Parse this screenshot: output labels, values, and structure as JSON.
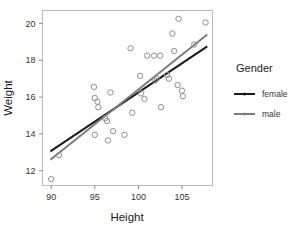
{
  "chart_data": {
    "type": "scatter",
    "title": "",
    "xlabel": "Height",
    "ylabel": "Weight",
    "xlim": [
      89.0,
      108.5
    ],
    "ylim": [
      11.2,
      20.7
    ],
    "xticks": [
      90,
      95,
      100,
      105
    ],
    "yticks": [
      12,
      14,
      16,
      18,
      20
    ],
    "xtick_labels": [
      "90",
      "95",
      "100",
      "105"
    ],
    "ytick_labels": [
      "12",
      "14",
      "16",
      "18",
      "20"
    ],
    "grid": false,
    "legend": {
      "title": "Gender",
      "position": "right",
      "entries": [
        {
          "label": "female",
          "color": "#1a1a1a"
        },
        {
          "label": "male",
          "color": "#7c7c7c"
        }
      ]
    },
    "marker": {
      "shape": "open-circle",
      "edge_color": "#8f8f8f",
      "fill": "none",
      "radius_px": 2.7
    },
    "points": [
      {
        "x": 90.0,
        "y": 11.55
      },
      {
        "x": 90.9,
        "y": 12.85
      },
      {
        "x": 94.9,
        "y": 16.55
      },
      {
        "x": 95.0,
        "y": 15.95
      },
      {
        "x": 95.0,
        "y": 13.95
      },
      {
        "x": 95.3,
        "y": 15.75
      },
      {
        "x": 95.4,
        "y": 15.45
      },
      {
        "x": 96.2,
        "y": 14.85
      },
      {
        "x": 96.4,
        "y": 14.7
      },
      {
        "x": 96.5,
        "y": 13.65
      },
      {
        "x": 96.8,
        "y": 16.25
      },
      {
        "x": 97.1,
        "y": 14.15
      },
      {
        "x": 98.4,
        "y": 13.95
      },
      {
        "x": 99.1,
        "y": 18.65
      },
      {
        "x": 99.3,
        "y": 15.15
      },
      {
        "x": 100.2,
        "y": 17.15
      },
      {
        "x": 100.3,
        "y": 16.2
      },
      {
        "x": 100.7,
        "y": 15.9
      },
      {
        "x": 101.0,
        "y": 18.25
      },
      {
        "x": 101.8,
        "y": 18.25
      },
      {
        "x": 101.9,
        "y": 16.9
      },
      {
        "x": 102.1,
        "y": 17.0
      },
      {
        "x": 102.5,
        "y": 18.25
      },
      {
        "x": 102.6,
        "y": 15.45
      },
      {
        "x": 103.3,
        "y": 17.2
      },
      {
        "x": 103.5,
        "y": 17.0
      },
      {
        "x": 103.9,
        "y": 19.45
      },
      {
        "x": 104.1,
        "y": 18.5
      },
      {
        "x": 104.5,
        "y": 16.65
      },
      {
        "x": 104.6,
        "y": 20.25
      },
      {
        "x": 105.0,
        "y": 16.35
      },
      {
        "x": 105.1,
        "y": 16.05
      },
      {
        "x": 106.4,
        "y": 18.85
      },
      {
        "x": 107.7,
        "y": 20.05
      }
    ],
    "fit_lines": [
      {
        "name": "female",
        "color": "#1a1a1a",
        "x_start": 89.9,
        "y_start": 13.05,
        "x_end": 107.9,
        "y_end": 18.75
      },
      {
        "name": "male",
        "color": "#7c7c7c",
        "x_start": 89.9,
        "y_start": 12.6,
        "x_end": 107.9,
        "y_end": 19.4
      }
    ]
  }
}
